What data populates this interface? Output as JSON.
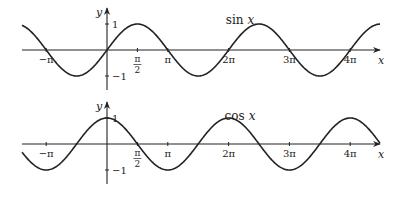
{
  "chart_data": [
    {
      "type": "line",
      "title": "sin x",
      "title_func": "sin",
      "title_var": "x",
      "function": "sin",
      "xlabel": "x",
      "ylabel": "y",
      "xlim": [
        -4.5,
        12.9
      ],
      "ylim": [
        -1,
        1
      ],
      "x_ticks": [
        {
          "value": -3.14159,
          "label": "−π"
        },
        {
          "value": 1.5708,
          "label_num": "π",
          "label_den": "2"
        },
        {
          "value": 3.14159,
          "label": "π"
        },
        {
          "value": 6.28319,
          "label": "2π"
        },
        {
          "value": 9.42478,
          "label": "3π"
        },
        {
          "value": 12.56637,
          "label": "4π"
        }
      ],
      "y_ticks": [
        {
          "value": 1,
          "label": "1"
        },
        {
          "value": -1,
          "label": "−1"
        }
      ],
      "grid": false
    },
    {
      "type": "line",
      "title": "cos x",
      "title_func": "cos",
      "title_var": "x",
      "function": "cos",
      "xlabel": "x",
      "ylabel": "y",
      "xlim": [
        -4.5,
        12.9
      ],
      "ylim": [
        -1,
        1
      ],
      "x_ticks": [
        {
          "value": -3.14159,
          "label": "−π"
        },
        {
          "value": 1.5708,
          "label_num": "π",
          "label_den": "2"
        },
        {
          "value": 3.14159,
          "label": "π"
        },
        {
          "value": 6.28319,
          "label": "2π"
        },
        {
          "value": 9.42478,
          "label": "3π"
        },
        {
          "value": 12.56637,
          "label": "4π"
        }
      ],
      "y_ticks": [
        {
          "value": 1,
          "label": "1"
        },
        {
          "value": -1,
          "label": "−1"
        }
      ],
      "grid": false
    }
  ]
}
